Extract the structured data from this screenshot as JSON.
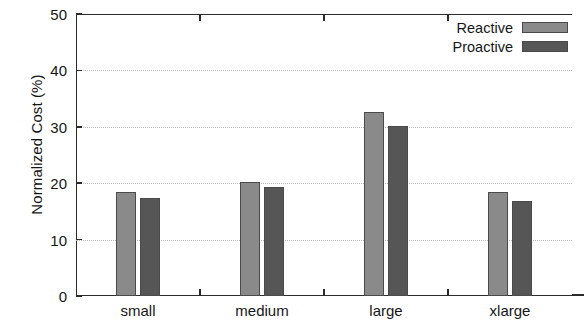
{
  "chart_data": {
    "type": "bar",
    "title": "",
    "xlabel": "",
    "ylabel": "Normalized Cost (%)",
    "categories": [
      "small",
      "medium",
      "large",
      "xlarge"
    ],
    "series": [
      {
        "name": "Reactive",
        "color": "#8a8a8a",
        "values": [
          18.4,
          20.3,
          32.7,
          18.4
        ]
      },
      {
        "name": "Proactive",
        "color": "#565656",
        "values": [
          17.3,
          19.4,
          30.1,
          16.9
        ]
      }
    ],
    "ylim": [
      0,
      50
    ],
    "yticks": [
      0,
      10,
      20,
      30,
      40,
      50
    ],
    "ytick_labels": [
      "0",
      "10",
      "20",
      "30",
      "40",
      "50"
    ],
    "grid": true,
    "grid_axis": "y",
    "legend_position": "top-right"
  },
  "legend": {
    "entries": [
      {
        "label": "Reactive",
        "color": "#8a8a8a"
      },
      {
        "label": "Proactive",
        "color": "#565656"
      }
    ]
  }
}
